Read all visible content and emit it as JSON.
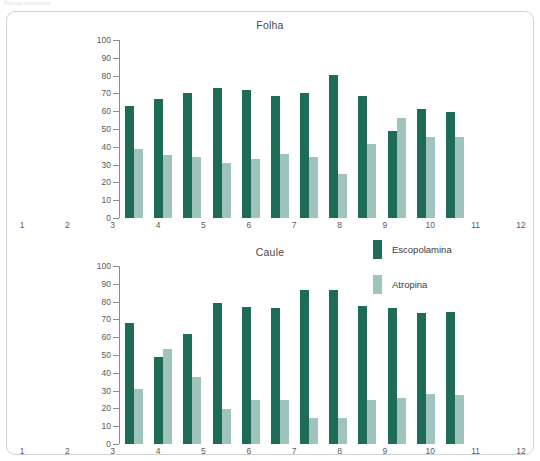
{
  "page": {
    "header_sliver": "Plantas medicinais"
  },
  "figure": {
    "legend": {
      "items": [
        {
          "label": "Escopolamina",
          "color": "#1e6b57"
        },
        {
          "label": "Atropina",
          "color": "#9fc4bd"
        }
      ]
    }
  },
  "chart_data": [
    {
      "type": "bar",
      "title": "Folha",
      "xlabel": "",
      "ylabel": "",
      "ylim": [
        0,
        100
      ],
      "yticks": [
        0,
        10,
        20,
        30,
        40,
        50,
        60,
        70,
        80,
        90,
        100
      ],
      "grid": false,
      "legend_position": "right",
      "categories": [
        "1",
        "2",
        "3",
        "4",
        "5",
        "6",
        "7",
        "8",
        "9",
        "10",
        "11",
        "12"
      ],
      "series": [
        {
          "name": "Escopolamina",
          "color": "#1e6b57",
          "values": [
            63,
            67,
            70.5,
            73,
            72,
            68.5,
            70.5,
            80.5,
            68.5,
            49,
            61,
            59.5
          ]
        },
        {
          "name": "Atropina",
          "color": "#9fc4bd",
          "values": [
            39,
            35.5,
            34,
            31,
            33,
            36,
            34,
            24.5,
            41.5,
            56,
            45.5,
            45.5
          ]
        }
      ]
    },
    {
      "type": "bar",
      "title": "Caule",
      "xlabel": "",
      "ylabel": "",
      "ylim": [
        0,
        100
      ],
      "yticks": [
        0,
        10,
        20,
        30,
        40,
        50,
        60,
        70,
        80,
        90,
        100
      ],
      "grid": false,
      "legend_position": "right",
      "categories": [
        "1",
        "2",
        "3",
        "4",
        "5",
        "6",
        "7",
        "8",
        "9",
        "10",
        "11",
        "12"
      ],
      "series": [
        {
          "name": "Escopolamina",
          "color": "#1e6b57",
          "values": [
            68,
            49,
            62,
            79.5,
            77,
            76.5,
            86.5,
            86.5,
            77.5,
            76.5,
            73.5,
            74
          ]
        },
        {
          "name": "Atropina",
          "color": "#9fc4bd",
          "values": [
            31,
            53.5,
            37.5,
            19.5,
            24.5,
            25,
            14.5,
            14.5,
            25,
            26,
            28,
            27.5
          ]
        }
      ]
    }
  ]
}
